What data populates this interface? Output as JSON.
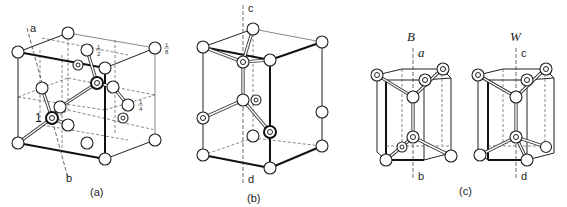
{
  "figure": {
    "panels": [
      {
        "id": "a",
        "caption": "(a)",
        "axis_labels": {
          "top": "a",
          "bottom": "b"
        },
        "site_label": "1",
        "height_fractions": [
          {
            "num": "1",
            "den": "2"
          },
          {
            "num": "1",
            "den": "8"
          },
          {
            "num": "1",
            "den": "4"
          }
        ]
      },
      {
        "id": "b",
        "caption": "(b)",
        "axis_labels": {
          "top": "c",
          "bottom": "d"
        }
      },
      {
        "id": "c",
        "caption": "(c)",
        "sub_views": [
          {
            "title": "B",
            "axis_labels": {
              "top": "a",
              "bottom": "b"
            }
          },
          {
            "title": "W",
            "axis_labels": {
              "top": "c",
              "bottom": "d"
            }
          }
        ]
      }
    ]
  }
}
